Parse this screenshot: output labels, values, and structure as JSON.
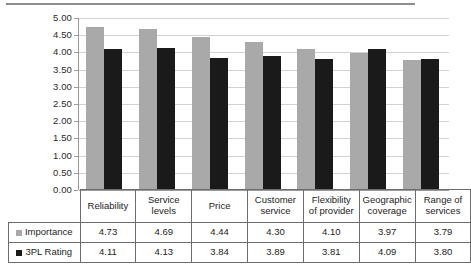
{
  "chart_data": {
    "type": "bar",
    "title": "",
    "subtitle": "",
    "xlabel": "",
    "ylabel": "",
    "ylim": [
      0,
      5
    ],
    "ytick_step": 0.5,
    "ytick_labels": [
      "5.00",
      "4.50",
      "4.00",
      "3.50",
      "3.00",
      "2.50",
      "2.00",
      "1.50",
      "1.00",
      "0.50",
      "0.00"
    ],
    "grid": true,
    "legend_position": "table-left-column",
    "categories": [
      "Reliability",
      "Service levels",
      "Price",
      "Customer service",
      "Flexibility of provider",
      "Geographic coverage",
      "Range of services"
    ],
    "category_lines": [
      [
        "Reliability"
      ],
      [
        "Service",
        "levels"
      ],
      [
        "Price"
      ],
      [
        "Customer",
        "service"
      ],
      [
        "Flexibility",
        "of provider"
      ],
      [
        "Geographic",
        "coverage"
      ],
      [
        "Range of",
        "services"
      ]
    ],
    "series": [
      {
        "name": "Importance",
        "color": "#a9a9a9",
        "values": [
          4.73,
          4.69,
          4.44,
          4.3,
          4.1,
          3.97,
          3.79
        ],
        "labels": [
          "4.73",
          "4.69",
          "4.44",
          "4.30",
          "4.10",
          "3.97",
          "3.79"
        ]
      },
      {
        "name": "3PL Rating",
        "color": "#1a1a1a",
        "values": [
          4.11,
          4.13,
          3.84,
          3.89,
          3.81,
          4.09,
          3.8
        ],
        "labels": [
          "4.11",
          "4.13",
          "3.84",
          "3.89",
          "3.81",
          "4.09",
          "3.80"
        ]
      }
    ]
  },
  "table": {
    "corner_label": "",
    "row_labels": [
      "Importance",
      "3PL Rating"
    ]
  }
}
